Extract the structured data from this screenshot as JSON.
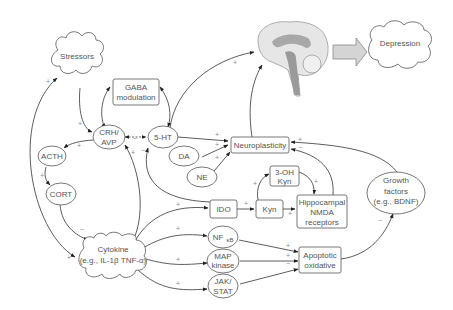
{
  "nodes": {
    "stressors": "Stressors",
    "depression": "Depression",
    "gaba_1": "GABA",
    "gaba_2": "modulation",
    "crh_1": "CRH/",
    "crh_2": "AVP",
    "ht5": "5-HT",
    "acth": "ACTH",
    "cort": "CORT",
    "da": "DA",
    "ne": "NE",
    "neuroplasticity": "Neuroplasticity",
    "oh_kyn_1": "3-OH",
    "oh_kyn_2": "Kyn",
    "ido": "IDO",
    "kyn": "Kyn",
    "hippo_1": "Hippocampal",
    "hippo_2": "NMDA",
    "hippo_3": "receptors",
    "growth_1": "Growth",
    "growth_2": "factors",
    "growth_3": "(e.g., BDNF)",
    "cytokine_1": "Cytokine",
    "cytokine_2": "(e.g., IL-1β TNF-α)",
    "nfkb": "NF",
    "nfkb_sub": "κB",
    "map_1": "MAP",
    "map_2": "kinase",
    "jak_1": "JAK/",
    "jak_2": "STAT",
    "apop_1": "Apoptotic",
    "apop_2": "oxidative"
  },
  "signs": {
    "plus": "+",
    "minus": "−"
  },
  "colors": {
    "edge": "#333333",
    "node_border": "#555555",
    "text": "#555555",
    "sign": "#8a8a8a",
    "brain_fill": "#e6e6e6",
    "brain_dark": "#9a9a9a",
    "arrow_fill": "#d4d4d4"
  }
}
